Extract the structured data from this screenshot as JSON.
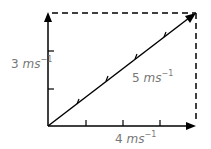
{
  "diagram": {
    "type": "vector-addition",
    "vertical_label": {
      "value": "3",
      "unit": "ms",
      "exp": "−1"
    },
    "horizontal_label": {
      "value": "4",
      "unit": "ms",
      "exp": "−1"
    },
    "resultant_label": {
      "value": "5",
      "unit": "ms",
      "exp": "−1"
    },
    "vertical_ticks": 2,
    "horizontal_ticks": 3,
    "resultant_ticks": 4,
    "colors": {
      "line": "#000000",
      "text": "#777777"
    }
  }
}
